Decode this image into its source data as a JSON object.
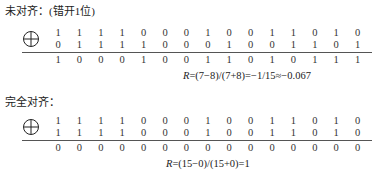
{
  "section1": {
    "heading": "未对齐：(错开1位)",
    "operator_icon": "xor-circle-plus-icon",
    "row_a": [
      1,
      1,
      1,
      1,
      0,
      0,
      0,
      1,
      0,
      0,
      1,
      1,
      0,
      1,
      0
    ],
    "row_b": [
      0,
      1,
      1,
      1,
      1,
      0,
      0,
      0,
      1,
      0,
      0,
      1,
      1,
      0,
      1
    ],
    "result": [
      1,
      0,
      0,
      0,
      1,
      0,
      0,
      1,
      1,
      0,
      1,
      0,
      1,
      1,
      1
    ],
    "formula_var": "R",
    "formula_rest": "=(7−8)/(7+8)=−1/15≈−0.067"
  },
  "section2": {
    "heading": "完全对齐：",
    "operator_icon": "xor-circle-plus-icon",
    "row_a": [
      1,
      1,
      1,
      1,
      0,
      0,
      0,
      1,
      0,
      0,
      1,
      1,
      0,
      1,
      0
    ],
    "row_b": [
      1,
      1,
      1,
      1,
      0,
      0,
      0,
      1,
      0,
      0,
      1,
      1,
      0,
      1,
      0
    ],
    "result": [
      0,
      0,
      0,
      0,
      0,
      0,
      0,
      0,
      0,
      0,
      0,
      0,
      0,
      0,
      0
    ],
    "formula_var": "R",
    "formula_rest": "=(15−0)/(15+0)=1"
  }
}
